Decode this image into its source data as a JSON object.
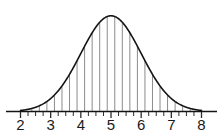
{
  "chart_data": {
    "type": "area",
    "title": "",
    "subtitle": "",
    "xlabel": "",
    "ylabel": "",
    "curve": {
      "distribution": "normal",
      "mean": 5,
      "stddev": 1,
      "peak_x": 5,
      "peak_y": 1.0
    },
    "xlim": [
      2,
      8
    ],
    "ylim": [
      0,
      1.05
    ],
    "grid": false,
    "legend": false,
    "legend_position": "none",
    "x_major_ticks": [
      2,
      3,
      4,
      5,
      6,
      7,
      8
    ],
    "x_tick_labels": [
      "2",
      "3",
      "4",
      "5",
      "6",
      "7",
      "8"
    ],
    "x_minor_tick_step": 0.25,
    "strip_step": 0.25,
    "strip_x_start": 2.375,
    "strip_x_end": 7.625,
    "x": [
      2.0,
      2.125,
      2.25,
      2.375,
      2.5,
      2.625,
      2.75,
      2.875,
      3.0,
      3.125,
      3.25,
      3.375,
      3.5,
      3.625,
      3.75,
      3.875,
      4.0,
      4.125,
      4.25,
      4.375,
      4.5,
      4.625,
      4.75,
      4.875,
      5.0,
      5.125,
      5.25,
      5.375,
      5.5,
      5.625,
      5.75,
      5.875,
      6.0,
      6.125,
      6.25,
      6.375,
      6.5,
      6.625,
      6.75,
      6.875,
      7.0,
      7.125,
      7.25,
      7.375,
      7.5,
      7.625,
      7.75,
      7.875,
      8.0
    ],
    "y": [
      0.011,
      0.016,
      0.022,
      0.03,
      0.044,
      0.059,
      0.079,
      0.104,
      0.135,
      0.173,
      0.217,
      0.269,
      0.325,
      0.387,
      0.457,
      0.527,
      0.607,
      0.68,
      0.754,
      0.821,
      0.882,
      0.93,
      0.969,
      0.992,
      1.0,
      0.992,
      0.969,
      0.93,
      0.882,
      0.821,
      0.754,
      0.68,
      0.607,
      0.527,
      0.457,
      0.387,
      0.325,
      0.269,
      0.217,
      0.173,
      0.135,
      0.104,
      0.079,
      0.059,
      0.044,
      0.03,
      0.022,
      0.016,
      0.011
    ],
    "colors": {
      "curve": "#141414",
      "strip": "#8c8c8c",
      "axis": "#141414",
      "tick": "#2b2b2b",
      "label": "#1a1a1a",
      "background": "#ffffff"
    }
  }
}
